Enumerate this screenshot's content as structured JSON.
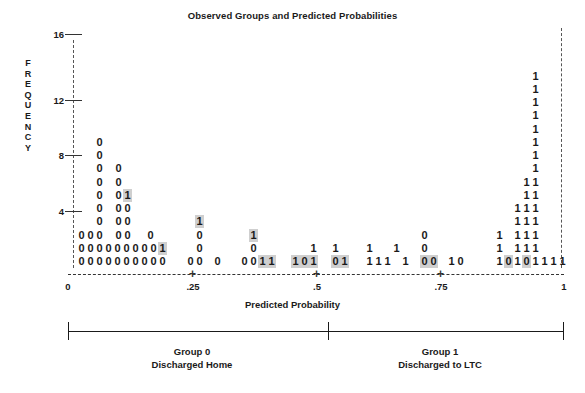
{
  "chart_data": {
    "type": "bar",
    "title": "Observed Groups and Predicted Probabilities",
    "xlabel": "Predicted Probability",
    "ylabel": "FREQUENCY",
    "ylim": [
      0,
      16
    ],
    "xlim": [
      0,
      1
    ],
    "grid": false,
    "legend": "none",
    "y_ticks": [
      16,
      12,
      8,
      4
    ],
    "x_ticks": [
      "0",
      ".25",
      ".5",
      ".75",
      "1"
    ],
    "symbols": {
      "group0": "0",
      "group1": "1"
    },
    "columns": [
      {
        "bin": 0,
        "symbols": "000",
        "count": 3
      },
      {
        "bin": 1,
        "symbols": "00",
        "count": 2
      },
      {
        "bin": 2,
        "symbols": "00",
        "count": 2
      },
      {
        "bin": 3,
        "symbols": "0000000000",
        "count": 10
      },
      {
        "bin": 4,
        "symbols": "00000000",
        "count": 8
      },
      {
        "bin": 5,
        "symbols": "000",
        "count": 3
      },
      {
        "bin": 6,
        "symbols": "001",
        "count": 3
      },
      {
        "bin": 7,
        "symbols": "01",
        "count": 2
      },
      {
        "bin": 8,
        "symbols": "0",
        "count": 1
      },
      {
        "bin": 9,
        "symbols": "100",
        "count": 3
      },
      {
        "bin": 10,
        "symbols": "0",
        "count": 1
      },
      {
        "bin": 11,
        "symbols": "0",
        "count": 1
      },
      {
        "bin": 12,
        "symbols": "100",
        "count": 3
      },
      {
        "bin": 13,
        "symbols": "1",
        "count": 1
      },
      {
        "bin": 14,
        "symbols": "1",
        "count": 1
      },
      {
        "bin": 15,
        "symbols": "1",
        "count": 1
      },
      {
        "bin": 16,
        "symbols": "0",
        "count": 1
      },
      {
        "bin": 17,
        "symbols": "1",
        "count": 1
      },
      {
        "bin": 18,
        "symbols": "1",
        "count": 1
      },
      {
        "bin": 19,
        "symbols": "1",
        "count": 1
      },
      {
        "bin": 20,
        "symbols": "1",
        "count": 1
      },
      {
        "bin": 21,
        "symbols": "1",
        "count": 1
      },
      {
        "bin": 22,
        "symbols": "000",
        "count": 3
      },
      {
        "bin": 23,
        "symbols": "0",
        "count": 1
      },
      {
        "bin": 24,
        "symbols": "1",
        "count": 1
      },
      {
        "bin": 25,
        "symbols": "0",
        "count": 1
      },
      {
        "bin": 26,
        "symbols": "1",
        "count": 1
      },
      {
        "bin": 27,
        "symbols": "1110",
        "count": 4
      },
      {
        "bin": 28,
        "symbols": "1",
        "count": 1
      },
      {
        "bin": 29,
        "symbols": "111111111111111",
        "count": 15
      },
      {
        "bin": 30,
        "symbols": "11111",
        "count": 5
      },
      {
        "bin": 31,
        "symbols": "111",
        "count": 3
      },
      {
        "bin": 32,
        "symbols": "1",
        "count": 1
      }
    ],
    "rows": [
      {
        "freq": 15,
        "cells": [
          {
            "x": 531,
            "ch": "1",
            "hl": false
          }
        ]
      },
      {
        "freq": 14,
        "cells": [
          {
            "x": 531,
            "ch": "1",
            "hl": false
          }
        ]
      },
      {
        "freq": 13,
        "cells": [
          {
            "x": 531,
            "ch": "1",
            "hl": false
          }
        ]
      },
      {
        "freq": 12,
        "cells": [
          {
            "x": 531,
            "ch": "1",
            "hl": false
          }
        ]
      },
      {
        "freq": 11,
        "cells": [
          {
            "x": 531,
            "ch": "1",
            "hl": false
          }
        ]
      },
      {
        "freq": 10,
        "cells": [
          {
            "x": 95,
            "ch": "0",
            "hl": false
          },
          {
            "x": 531,
            "ch": "1",
            "hl": false
          }
        ]
      },
      {
        "freq": 9,
        "cells": [
          {
            "x": 95,
            "ch": "0",
            "hl": false
          },
          {
            "x": 531,
            "ch": "1",
            "hl": false
          }
        ]
      },
      {
        "freq": 8,
        "cells": [
          {
            "x": 95,
            "ch": "0",
            "hl": false
          },
          {
            "x": 114,
            "ch": "0",
            "hl": false
          },
          {
            "x": 531,
            "ch": "1",
            "hl": false
          }
        ]
      },
      {
        "freq": 7,
        "cells": [
          {
            "x": 95,
            "ch": "0",
            "hl": false
          },
          {
            "x": 114,
            "ch": "0",
            "hl": false
          },
          {
            "x": 522,
            "ch": "1",
            "hl": false
          },
          {
            "x": 531,
            "ch": "1",
            "hl": false
          }
        ]
      },
      {
        "freq": 6,
        "cells": [
          {
            "x": 95,
            "ch": "0",
            "hl": false
          },
          {
            "x": 114,
            "ch": "0",
            "hl": false
          },
          {
            "x": 123,
            "ch": "1",
            "hl": true
          },
          {
            "x": 522,
            "ch": "1",
            "hl": false
          },
          {
            "x": 531,
            "ch": "1",
            "hl": false
          }
        ]
      },
      {
        "freq": 5,
        "cells": [
          {
            "x": 95,
            "ch": "0",
            "hl": false
          },
          {
            "x": 114,
            "ch": "0",
            "hl": false
          },
          {
            "x": 123,
            "ch": "0",
            "hl": false
          },
          {
            "x": 513,
            "ch": "1",
            "hl": false
          },
          {
            "x": 522,
            "ch": "1",
            "hl": false
          },
          {
            "x": 531,
            "ch": "1",
            "hl": false
          }
        ]
      },
      {
        "freq": 4,
        "cells": [
          {
            "x": 95,
            "ch": "0",
            "hl": false
          },
          {
            "x": 114,
            "ch": "0",
            "hl": false
          },
          {
            "x": 123,
            "ch": "0",
            "hl": false
          },
          {
            "x": 195,
            "ch": "1",
            "hl": true
          },
          {
            "x": 513,
            "ch": "1",
            "hl": false
          },
          {
            "x": 522,
            "ch": "1",
            "hl": false
          },
          {
            "x": 531,
            "ch": "1",
            "hl": false
          }
        ]
      },
      {
        "freq": 3,
        "cells": [
          {
            "x": 77,
            "ch": "0",
            "hl": false
          },
          {
            "x": 86,
            "ch": "0",
            "hl": false
          },
          {
            "x": 95,
            "ch": "0",
            "hl": false
          },
          {
            "x": 114,
            "ch": "0",
            "hl": false
          },
          {
            "x": 123,
            "ch": "0",
            "hl": false
          },
          {
            "x": 146,
            "ch": "0",
            "hl": false
          },
          {
            "x": 195,
            "ch": "0",
            "hl": false
          },
          {
            "x": 249,
            "ch": "1",
            "hl": true
          },
          {
            "x": 420,
            "ch": "0",
            "hl": false
          },
          {
            "x": 495,
            "ch": "1",
            "hl": false
          },
          {
            "x": 513,
            "ch": "1",
            "hl": false
          },
          {
            "x": 522,
            "ch": "1",
            "hl": false
          },
          {
            "x": 531,
            "ch": "1",
            "hl": false
          }
        ]
      },
      {
        "freq": 2,
        "cells": [
          {
            "x": 77,
            "ch": "0",
            "hl": false
          },
          {
            "x": 86,
            "ch": "0",
            "hl": false
          },
          {
            "x": 95,
            "ch": "0",
            "hl": false
          },
          {
            "x": 104,
            "ch": "0",
            "hl": false
          },
          {
            "x": 113,
            "ch": "0",
            "hl": false
          },
          {
            "x": 122,
            "ch": "0",
            "hl": false
          },
          {
            "x": 131,
            "ch": "0",
            "hl": false
          },
          {
            "x": 140,
            "ch": "0",
            "hl": false
          },
          {
            "x": 149,
            "ch": "0",
            "hl": false
          },
          {
            "x": 158,
            "ch": "1",
            "hl": true
          },
          {
            "x": 195,
            "ch": "0",
            "hl": false
          },
          {
            "x": 249,
            "ch": "0",
            "hl": false
          },
          {
            "x": 309,
            "ch": "1",
            "hl": false
          },
          {
            "x": 331,
            "ch": "1",
            "hl": false
          },
          {
            "x": 365,
            "ch": "1",
            "hl": false
          },
          {
            "x": 392,
            "ch": "1",
            "hl": false
          },
          {
            "x": 420,
            "ch": "0",
            "hl": false
          },
          {
            "x": 495,
            "ch": "1",
            "hl": false
          },
          {
            "x": 513,
            "ch": "1",
            "hl": false
          },
          {
            "x": 522,
            "ch": "1",
            "hl": false
          },
          {
            "x": 531,
            "ch": "1",
            "hl": false
          }
        ]
      },
      {
        "freq": 1,
        "cells": [
          {
            "x": 77,
            "ch": "0",
            "hl": false
          },
          {
            "x": 86,
            "ch": "0",
            "hl": false
          },
          {
            "x": 95,
            "ch": "0",
            "hl": false
          },
          {
            "x": 104,
            "ch": "0",
            "hl": false
          },
          {
            "x": 113,
            "ch": "0",
            "hl": false
          },
          {
            "x": 122,
            "ch": "0",
            "hl": false
          },
          {
            "x": 131,
            "ch": "0",
            "hl": false
          },
          {
            "x": 140,
            "ch": "0",
            "hl": false
          },
          {
            "x": 149,
            "ch": "0",
            "hl": false
          },
          {
            "x": 158,
            "ch": "0",
            "hl": false
          },
          {
            "x": 186,
            "ch": "0",
            "hl": false
          },
          {
            "x": 195,
            "ch": "0",
            "hl": false
          },
          {
            "x": 213,
            "ch": "0",
            "hl": false
          },
          {
            "x": 240,
            "ch": "0",
            "hl": false
          },
          {
            "x": 249,
            "ch": "0",
            "hl": false
          },
          {
            "x": 258,
            "ch": "1",
            "hl": true
          },
          {
            "x": 267,
            "ch": "1",
            "hl": true
          },
          {
            "x": 291,
            "ch": "1",
            "hl": true
          },
          {
            "x": 300,
            "ch": "0",
            "hl": true
          },
          {
            "x": 309,
            "ch": "1",
            "hl": true
          },
          {
            "x": 331,
            "ch": "0",
            "hl": true
          },
          {
            "x": 340,
            "ch": "1",
            "hl": true
          },
          {
            "x": 365,
            "ch": "1",
            "hl": false
          },
          {
            "x": 374,
            "ch": "1",
            "hl": false
          },
          {
            "x": 383,
            "ch": "1",
            "hl": false
          },
          {
            "x": 401,
            "ch": "1",
            "hl": false
          },
          {
            "x": 420,
            "ch": "0",
            "hl": true
          },
          {
            "x": 429,
            "ch": "0",
            "hl": true
          },
          {
            "x": 447,
            "ch": "1",
            "hl": false
          },
          {
            "x": 456,
            "ch": "0",
            "hl": false
          },
          {
            "x": 495,
            "ch": "1",
            "hl": false
          },
          {
            "x": 504,
            "ch": "0",
            "hl": true
          },
          {
            "x": 513,
            "ch": "1",
            "hl": false
          },
          {
            "x": 522,
            "ch": "0",
            "hl": true
          },
          {
            "x": 531,
            "ch": "1",
            "hl": false
          },
          {
            "x": 540,
            "ch": "1",
            "hl": false
          },
          {
            "x": 549,
            "ch": "1",
            "hl": false
          },
          {
            "x": 558,
            "ch": "1",
            "hl": false
          }
        ]
      }
    ]
  },
  "axis": {
    "y_label_letters": [
      "F",
      "R",
      "E",
      "Q",
      "U",
      "E",
      "N",
      "C",
      "Y"
    ],
    "y_ticks": [
      {
        "value": "16",
        "top": 34
      },
      {
        "value": "12",
        "top": 100
      },
      {
        "value": "8",
        "top": 155
      },
      {
        "value": "4",
        "top": 211
      }
    ],
    "x_ticks": [
      {
        "label": "0",
        "left": 68
      },
      {
        "label": ".25",
        "left": 193
      },
      {
        "label": ".5",
        "left": 317
      },
      {
        "label": ".75",
        "left": 441
      },
      {
        "label": "1",
        "left": 564
      }
    ],
    "x_title": "Predicted Probability"
  },
  "groups": [
    {
      "name": "Group 0",
      "desc": "Discharged Home",
      "center": 192
    },
    {
      "name": "Group 1",
      "desc": "Discharged to LTC",
      "center": 440
    }
  ]
}
